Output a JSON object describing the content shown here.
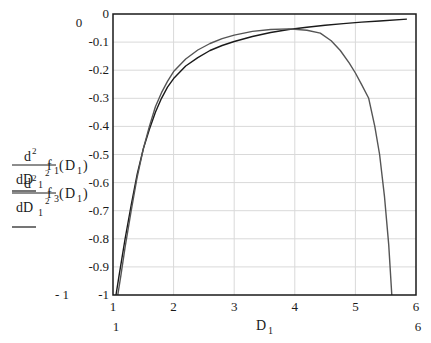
{
  "chart_data": {
    "type": "line",
    "title": "",
    "xlabel": "D 1",
    "ylabel": "d²/dD1² f1(D1), d²/dD1² f3(D1)",
    "xlim": [
      1,
      6
    ],
    "ylim": [
      -1,
      0
    ],
    "grid": true,
    "legend": "none (expressions shown as y-axis labels)",
    "x_ticks": [
      "1",
      "2",
      "3",
      "4",
      "5",
      "6"
    ],
    "y_ticks": [
      "0",
      "-0.1",
      "-0.2",
      "-0.3",
      "-0.4",
      "-0.5",
      "-0.6",
      "-0.7",
      "-0.8",
      "-0.9",
      "-1"
    ],
    "x_range_labels": {
      "min": "1",
      "max": "6"
    },
    "y_range_labels": {
      "max": "0",
      "min": "- 1"
    },
    "series": [
      {
        "name": "d²/dD1² f1(D1)",
        "color": "#1a1a1a",
        "x": [
          1.05,
          1.1,
          1.2,
          1.3,
          1.4,
          1.5,
          1.6,
          1.7,
          1.8,
          1.9,
          2.0,
          2.2,
          2.4,
          2.6,
          2.8,
          3.0,
          3.3,
          3.6,
          3.9,
          4.2,
          4.5,
          4.8,
          5.1,
          5.4,
          5.85
        ],
        "y": [
          -1.0,
          -0.93,
          -0.8,
          -0.68,
          -0.57,
          -0.48,
          -0.41,
          -0.35,
          -0.3,
          -0.26,
          -0.23,
          -0.185,
          -0.155,
          -0.13,
          -0.112,
          -0.098,
          -0.08,
          -0.066,
          -0.055,
          -0.047,
          -0.04,
          -0.034,
          -0.029,
          -0.025,
          -0.018
        ]
      },
      {
        "name": "d²/dD1² f3(D1)",
        "color": "#555555",
        "x": [
          1.08,
          1.13,
          1.2,
          1.3,
          1.4,
          1.5,
          1.6,
          1.7,
          1.8,
          1.9,
          2.0,
          2.2,
          2.4,
          2.6,
          2.8,
          3.0,
          3.3,
          3.6,
          3.9,
          4.2,
          4.42,
          4.6,
          4.75,
          4.9,
          5.0,
          5.1,
          5.22,
          5.32,
          5.4,
          5.48,
          5.55,
          5.6
        ],
        "y": [
          -1.0,
          -0.93,
          -0.83,
          -0.7,
          -0.58,
          -0.48,
          -0.4,
          -0.33,
          -0.28,
          -0.24,
          -0.205,
          -0.16,
          -0.128,
          -0.105,
          -0.088,
          -0.075,
          -0.062,
          -0.055,
          -0.053,
          -0.058,
          -0.068,
          -0.095,
          -0.13,
          -0.175,
          -0.21,
          -0.25,
          -0.3,
          -0.4,
          -0.5,
          -0.65,
          -0.82,
          -1.0
        ]
      }
    ]
  },
  "axis_text": {
    "y_top_range": "0",
    "y_bottom_range": "- 1",
    "x_left_range": "1",
    "x_right_range": "6",
    "x_title": "D",
    "x_title_sub": "1",
    "expr1": {
      "num": "d",
      "num_sup": "2",
      "den": "dD",
      "den_sub": "1",
      "den_sup": "2",
      "fn": "f",
      "fn_sub": "1",
      "arg": "D",
      "arg_sub": "1"
    },
    "expr2": {
      "num": "d",
      "num_sup": "2",
      "den": "dD",
      "den_sub": "1",
      "den_sup": "2",
      "fn": "f",
      "fn_sub": "3",
      "arg": "D",
      "arg_sub": "1"
    }
  },
  "layout": {
    "plot": {
      "left": 113,
      "top": 14,
      "right": 416,
      "bottom": 295
    },
    "grid_color": "#d9d9d9",
    "frame_color": "#1a1a1a"
  }
}
